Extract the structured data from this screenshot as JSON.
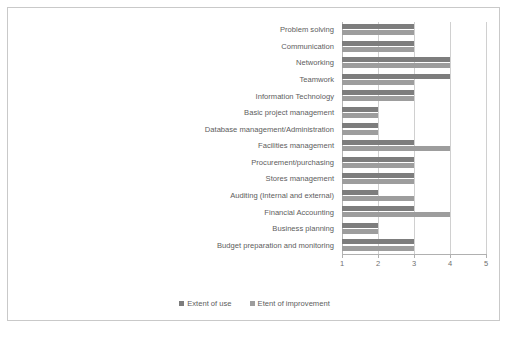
{
  "figure": {
    "caption_top": "",
    "caption_bottom": ""
  },
  "legend": {
    "position": "bottom-center",
    "entries": [
      {
        "label": "Extent of use",
        "color": "#7d7d7d",
        "key": "use"
      },
      {
        "label": "Etent of improvement",
        "color": "#9d9d9d",
        "key": "improve"
      }
    ]
  },
  "axis": {
    "ticks": [
      "1",
      "2",
      "3",
      "4",
      "5"
    ],
    "min": 1,
    "max": 5
  },
  "chart_data": {
    "type": "bar",
    "orientation": "horizontal",
    "title": "",
    "xlabel": "",
    "ylabel": "",
    "xlim": [
      1,
      5
    ],
    "grid": true,
    "legend_position": "bottom-center",
    "tick_labels": [
      "1",
      "2",
      "3",
      "4",
      "5"
    ],
    "categories": [
      "Problem solving",
      "Communication",
      "Networking",
      "Teamwork",
      "Information Technology",
      "Basic project management",
      "Database management/Administration",
      "Facilities management",
      "Procurement/purchasing",
      "Stores management",
      "Auditing (Internal and external)",
      "Financial Accounting",
      "Business planning",
      "Budget preparation and monitoring"
    ],
    "series": [
      {
        "name": "Extent of use",
        "color": "#7d7d7d",
        "values": [
          3,
          3,
          4,
          4,
          3,
          2,
          2,
          3,
          3,
          3,
          2,
          3,
          2,
          3
        ]
      },
      {
        "name": "Etent of improvement",
        "color": "#9d9d9d",
        "values": [
          3,
          3,
          4,
          3,
          3,
          2,
          2,
          4,
          3,
          3,
          3,
          4,
          2,
          3
        ]
      }
    ]
  }
}
